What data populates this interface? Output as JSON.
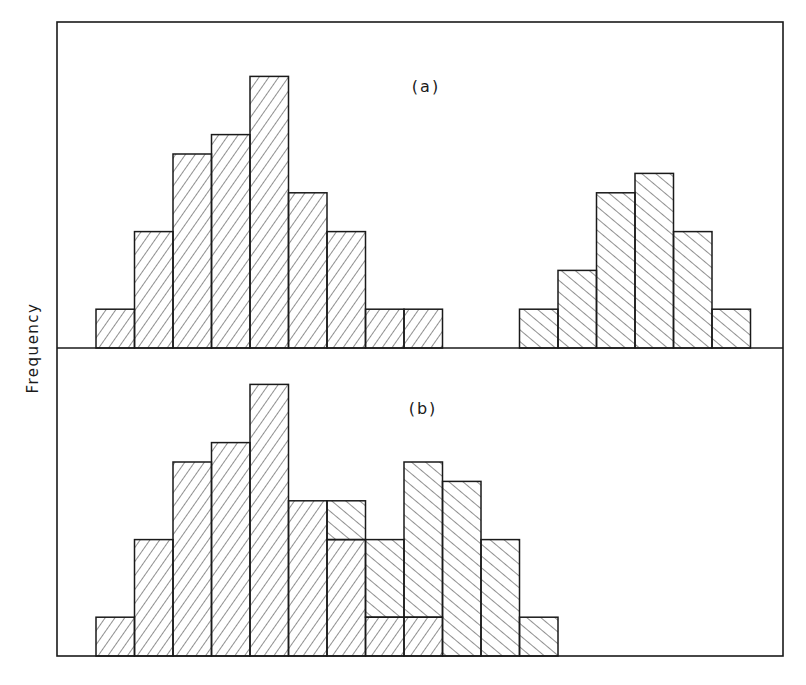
{
  "chart_data": [
    {
      "type": "bar",
      "panel": "a",
      "title": "(a)",
      "xlabel": "",
      "ylabel": "Frequency",
      "grid": false,
      "bins": [
        0,
        1,
        2,
        3,
        4,
        5,
        6,
        7,
        8,
        9,
        10,
        11,
        12,
        13,
        14,
        15,
        16
      ],
      "series": [
        {
          "name": "Population A",
          "hatch": "forward-slash",
          "start_bin": 0,
          "values": [
            2,
            6,
            10,
            11,
            14,
            8,
            6,
            2,
            2
          ]
        },
        {
          "name": "Population B",
          "hatch": "back-slash",
          "start_bin": 11,
          "values": [
            2,
            4,
            8,
            9,
            6,
            2
          ]
        }
      ],
      "ylim": [
        0,
        16
      ]
    },
    {
      "type": "bar",
      "panel": "b",
      "title": "(b)",
      "stacked": true,
      "xlabel": "",
      "ylabel": "Frequency",
      "grid": false,
      "bins": [
        0,
        1,
        2,
        3,
        4,
        5,
        6,
        7,
        8,
        9,
        10,
        11
      ],
      "series": [
        {
          "name": "Population A",
          "hatch": "forward-slash",
          "start_bin": 0,
          "values": [
            2,
            6,
            10,
            11,
            14,
            8,
            6,
            2,
            2
          ]
        },
        {
          "name": "Population B",
          "hatch": "back-slash",
          "start_bin": 6,
          "values": [
            2,
            4,
            8,
            9,
            6,
            2
          ]
        }
      ],
      "totals": [
        2,
        6,
        10,
        11,
        14,
        8,
        8,
        6,
        10,
        9,
        6,
        2
      ],
      "ylim": [
        0,
        16
      ]
    }
  ],
  "labels": {
    "ylabel": "Frequency",
    "panel_a": "(a)",
    "panel_b": "(b)"
  },
  "layout": {
    "frame": {
      "x0": 57,
      "y0": 22,
      "x1": 783,
      "y1": 656
    },
    "divider_y": 348,
    "bin_origin_x": 96,
    "bin_width": 38.5,
    "unit_height": 19.4,
    "panel_a_baseline": 348,
    "panel_b_baseline": 656,
    "label_a_pos": [
      426,
      86
    ],
    "label_b_pos": [
      423,
      408
    ]
  },
  "colors": {
    "stroke": "#1a1a1a",
    "hatch": "#333333",
    "background": "#ffffff"
  }
}
